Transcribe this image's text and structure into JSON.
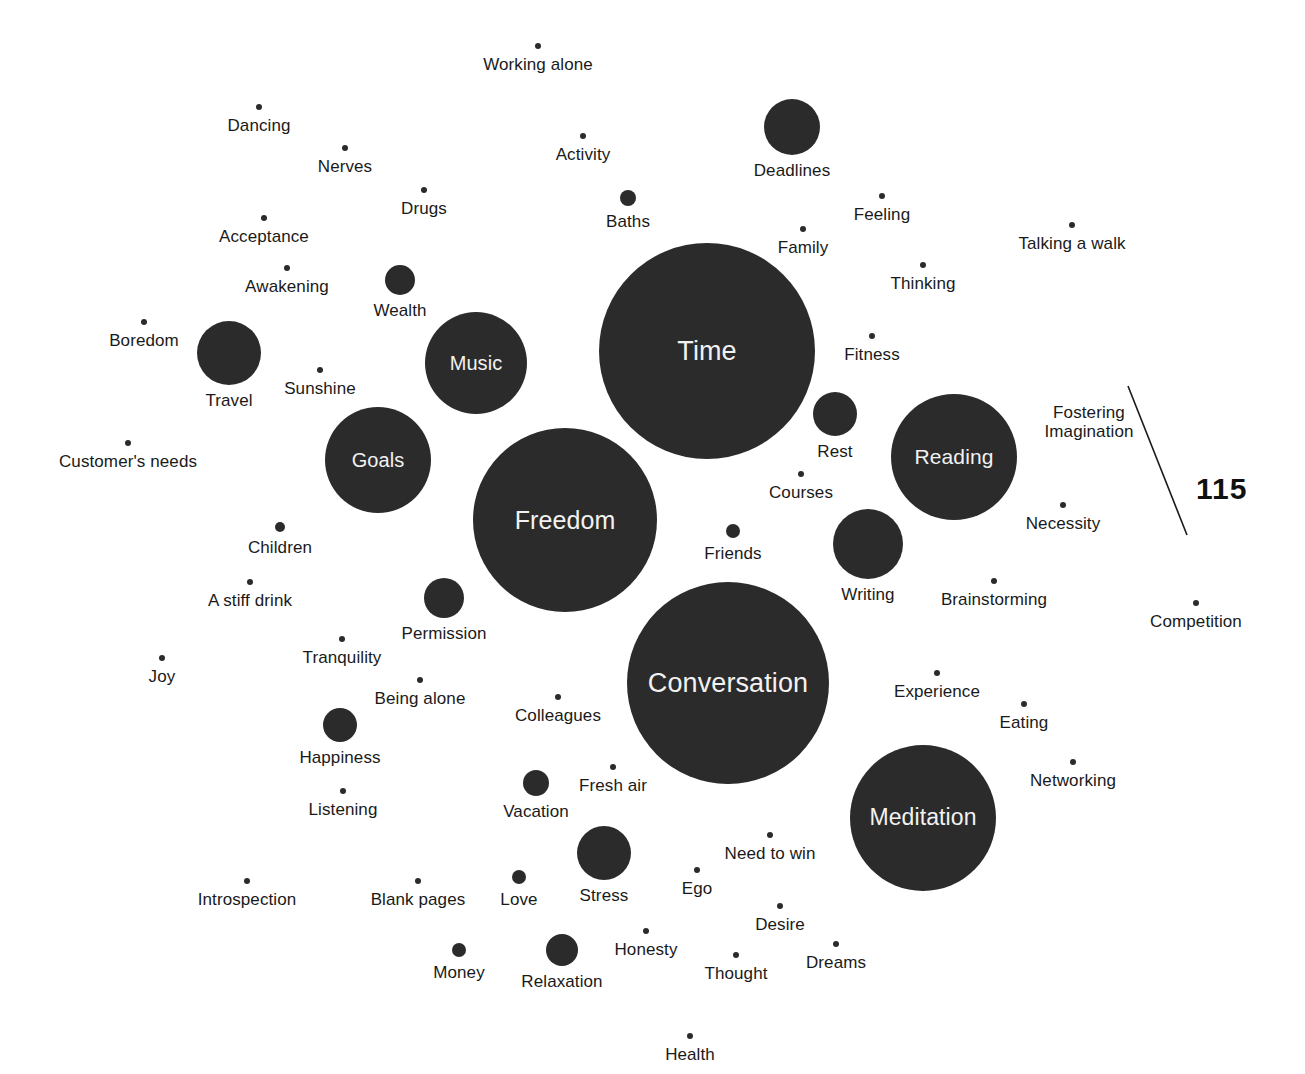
{
  "figure": {
    "type": "bubble-cloud",
    "background_color": "#ffffff",
    "bubble_color": "#2b2b2b",
    "inside_label_color": "#f2f2f2",
    "outside_label_color": "#1a1a1a",
    "width": 1305,
    "height": 1074
  },
  "page_number": "115",
  "chart_data": {
    "type": "scatter",
    "title": "",
    "subtitle": "",
    "xlabel": "",
    "ylabel": "",
    "grid": false,
    "legend": "none",
    "note": "Bubble cloud: each item is a labelled circle; circle radius encodes relative magnitude. Labels inside large circles, beneath small circles.",
    "categories": [
      "Working alone",
      "Dancing",
      "Nerves",
      "Activity",
      "Deadlines",
      "Drugs",
      "Baths",
      "Feeling",
      "Acceptance",
      "Family",
      "Talking a walk",
      "Awakening",
      "Wealth",
      "Thinking",
      "Boredom",
      "Travel",
      "Music",
      "Time",
      "Fitness",
      "Sunshine",
      "Goals",
      "Rest",
      "Reading",
      "Fostering Imagination",
      "Customer's needs",
      "Courses",
      "Freedom",
      "Necessity",
      "Children",
      "Friends",
      "Writing",
      "Brainstorming",
      "A stiff drink",
      "Permission",
      "Competition",
      "Tranquility",
      "Joy",
      "Being alone",
      "Conversation",
      "Experience",
      "Happiness",
      "Colleagues",
      "Eating",
      "Listening",
      "Vacation",
      "Fresh air",
      "Networking",
      "Meditation",
      "Need to win",
      "Stress",
      "Introspection",
      "Blank pages",
      "Love",
      "Ego",
      "Desire",
      "Money",
      "Relaxation",
      "Honesty",
      "Thought",
      "Dreams",
      "Health"
    ],
    "values": [
      2,
      2,
      2,
      2,
      28,
      2,
      8,
      2,
      2,
      2,
      2,
      2,
      15,
      2,
      2,
      32,
      51,
      108,
      2,
      2,
      53,
      22,
      63,
      2,
      2,
      2,
      92,
      2,
      4,
      7,
      35,
      2,
      2,
      20,
      2,
      2,
      2,
      2,
      101,
      2,
      17,
      2,
      2,
      2,
      13,
      2,
      2,
      73,
      2,
      27,
      2,
      2,
      7,
      2,
      2,
      7,
      16,
      2,
      2,
      2,
      2
    ]
  },
  "bubbles": [
    {
      "label": "Working alone",
      "x": 538,
      "y": 46,
      "r": 3,
      "inside": false
    },
    {
      "label": "Dancing",
      "x": 259,
      "y": 107,
      "r": 3,
      "inside": false
    },
    {
      "label": "Nerves",
      "x": 345,
      "y": 148,
      "r": 3,
      "inside": false
    },
    {
      "label": "Activity",
      "x": 583,
      "y": 136,
      "r": 3,
      "inside": false
    },
    {
      "label": "Deadlines",
      "x": 792,
      "y": 127,
      "r": 28,
      "inside": false
    },
    {
      "label": "Drugs",
      "x": 424,
      "y": 190,
      "r": 3,
      "inside": false
    },
    {
      "label": "Baths",
      "x": 628,
      "y": 198,
      "r": 8,
      "inside": false
    },
    {
      "label": "Feeling",
      "x": 882,
      "y": 196,
      "r": 3,
      "inside": false
    },
    {
      "label": "Acceptance",
      "x": 264,
      "y": 218,
      "r": 3,
      "inside": false
    },
    {
      "label": "Family",
      "x": 803,
      "y": 229,
      "r": 3,
      "inside": false
    },
    {
      "label": "Talking a walk",
      "x": 1072,
      "y": 225,
      "r": 3,
      "inside": false
    },
    {
      "label": "Awakening",
      "x": 287,
      "y": 268,
      "r": 3,
      "inside": false
    },
    {
      "label": "Wealth",
      "x": 400,
      "y": 280,
      "r": 15,
      "inside": false
    },
    {
      "label": "Thinking",
      "x": 923,
      "y": 265,
      "r": 3,
      "inside": false
    },
    {
      "label": "Boredom",
      "x": 144,
      "y": 322,
      "r": 3,
      "inside": false
    },
    {
      "label": "Travel",
      "x": 229,
      "y": 353,
      "r": 32,
      "inside": false
    },
    {
      "label": "Music",
      "x": 476,
      "y": 363,
      "r": 51,
      "inside": true
    },
    {
      "label": "Time",
      "x": 707,
      "y": 351,
      "r": 108,
      "inside": true
    },
    {
      "label": "Fitness",
      "x": 872,
      "y": 336,
      "r": 3,
      "inside": false
    },
    {
      "label": "Sunshine",
      "x": 320,
      "y": 370,
      "r": 3,
      "inside": false
    },
    {
      "label": "Goals",
      "x": 378,
      "y": 460,
      "r": 53,
      "inside": true
    },
    {
      "label": "Rest",
      "x": 835,
      "y": 414,
      "r": 22,
      "inside": false
    },
    {
      "label": "Reading",
      "x": 954,
      "y": 457,
      "r": 63,
      "inside": true
    },
    {
      "label": "Fostering\nImagination",
      "x": 1089,
      "y": 397,
      "r": 0,
      "inside": false
    },
    {
      "label": "Customer's needs",
      "x": 128,
      "y": 443,
      "r": 3,
      "inside": false
    },
    {
      "label": "Courses",
      "x": 801,
      "y": 474,
      "r": 3,
      "inside": false
    },
    {
      "label": "Freedom",
      "x": 565,
      "y": 520,
      "r": 92,
      "inside": true
    },
    {
      "label": "Necessity",
      "x": 1063,
      "y": 505,
      "r": 3,
      "inside": false
    },
    {
      "label": "Children",
      "x": 280,
      "y": 527,
      "r": 5,
      "inside": false
    },
    {
      "label": "Friends",
      "x": 733,
      "y": 531,
      "r": 7,
      "inside": false
    },
    {
      "label": "Writing",
      "x": 868,
      "y": 544,
      "r": 35,
      "inside": false
    },
    {
      "label": "Brainstorming",
      "x": 994,
      "y": 581,
      "r": 3,
      "inside": false
    },
    {
      "label": "A stiff drink",
      "x": 250,
      "y": 582,
      "r": 3,
      "inside": false
    },
    {
      "label": "Permission",
      "x": 444,
      "y": 598,
      "r": 20,
      "inside": false
    },
    {
      "label": "Competition",
      "x": 1196,
      "y": 603,
      "r": 3,
      "inside": false
    },
    {
      "label": "Tranquility",
      "x": 342,
      "y": 639,
      "r": 3,
      "inside": false
    },
    {
      "label": "Joy",
      "x": 162,
      "y": 658,
      "r": 3,
      "inside": false
    },
    {
      "label": "Being alone",
      "x": 420,
      "y": 680,
      "r": 3,
      "inside": false
    },
    {
      "label": "Conversation",
      "x": 728,
      "y": 683,
      "r": 101,
      "inside": true
    },
    {
      "label": "Experience",
      "x": 937,
      "y": 673,
      "r": 3,
      "inside": false
    },
    {
      "label": "Happiness",
      "x": 340,
      "y": 725,
      "r": 17,
      "inside": false
    },
    {
      "label": "Colleagues",
      "x": 558,
      "y": 697,
      "r": 3,
      "inside": false
    },
    {
      "label": "Eating",
      "x": 1024,
      "y": 704,
      "r": 3,
      "inside": false
    },
    {
      "label": "Listening",
      "x": 343,
      "y": 791,
      "r": 3,
      "inside": false
    },
    {
      "label": "Vacation",
      "x": 536,
      "y": 783,
      "r": 13,
      "inside": false
    },
    {
      "label": "Fresh air",
      "x": 613,
      "y": 767,
      "r": 3,
      "inside": false
    },
    {
      "label": "Networking",
      "x": 1073,
      "y": 762,
      "r": 3,
      "inside": false
    },
    {
      "label": "Meditation",
      "x": 923,
      "y": 818,
      "r": 73,
      "inside": true
    },
    {
      "label": "Need to win",
      "x": 770,
      "y": 835,
      "r": 3,
      "inside": false
    },
    {
      "label": "Stress",
      "x": 604,
      "y": 853,
      "r": 27,
      "inside": false
    },
    {
      "label": "Introspection",
      "x": 247,
      "y": 881,
      "r": 3,
      "inside": false
    },
    {
      "label": "Blank pages",
      "x": 418,
      "y": 881,
      "r": 3,
      "inside": false
    },
    {
      "label": "Love",
      "x": 519,
      "y": 877,
      "r": 7,
      "inside": false
    },
    {
      "label": "Ego",
      "x": 697,
      "y": 870,
      "r": 3,
      "inside": false
    },
    {
      "label": "Desire",
      "x": 780,
      "y": 906,
      "r": 3,
      "inside": false
    },
    {
      "label": "Money",
      "x": 459,
      "y": 950,
      "r": 7,
      "inside": false
    },
    {
      "label": "Relaxation",
      "x": 562,
      "y": 950,
      "r": 16,
      "inside": false
    },
    {
      "label": "Honesty",
      "x": 646,
      "y": 931,
      "r": 3,
      "inside": false
    },
    {
      "label": "Thought",
      "x": 736,
      "y": 955,
      "r": 3,
      "inside": false
    },
    {
      "label": "Dreams",
      "x": 836,
      "y": 944,
      "r": 3,
      "inside": false
    },
    {
      "label": "Health",
      "x": 690,
      "y": 1036,
      "r": 3,
      "inside": false
    }
  ]
}
